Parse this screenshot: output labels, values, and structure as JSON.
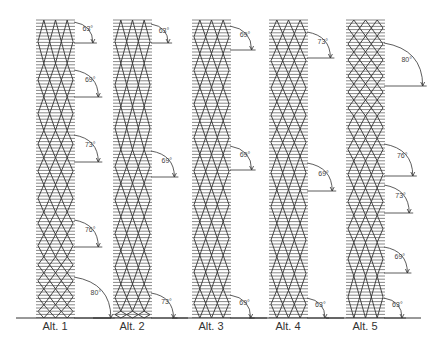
{
  "figure": {
    "baseline_y": 318,
    "top_y": 20,
    "columns": [
      {
        "label": "Alt. 1",
        "x": 38,
        "width": 35,
        "angles": [
          {
            "value": "63°",
            "y_top": 22,
            "y_bottom": 43
          },
          {
            "value": "69°",
            "y_top": 70,
            "y_bottom": 97
          },
          {
            "value": "73°",
            "y_top": 135,
            "y_bottom": 162
          },
          {
            "value": "76°",
            "y_top": 220,
            "y_bottom": 247
          },
          {
            "value": "80°",
            "y_top": 277,
            "y_bottom": 318
          }
        ]
      },
      {
        "label": "Alt. 2",
        "x": 115,
        "width": 35,
        "angles": [
          {
            "value": "63°",
            "y_top": 24,
            "y_bottom": 43
          },
          {
            "value": "69°",
            "y_top": 151,
            "y_bottom": 177
          },
          {
            "value": "73°",
            "y_top": 293,
            "y_bottom": 318
          }
        ]
      },
      {
        "label": "Alt. 3",
        "x": 194,
        "width": 35,
        "angles": [
          {
            "value": "69°",
            "y_top": 26,
            "y_bottom": 50
          },
          {
            "value": "69°",
            "y_top": 146,
            "y_bottom": 170
          },
          {
            "value": "69°",
            "y_top": 295,
            "y_bottom": 318
          }
        ]
      },
      {
        "label": "Alt. 4",
        "x": 271,
        "width": 35,
        "angles": [
          {
            "value": "73°",
            "y_top": 32,
            "y_bottom": 58
          },
          {
            "value": "69°",
            "y_top": 163,
            "y_bottom": 191
          },
          {
            "value": "63°",
            "y_top": 298,
            "y_bottom": 318
          }
        ]
      },
      {
        "label": "Alt. 5",
        "x": 348,
        "width": 35,
        "angles": [
          {
            "value": "80°",
            "y_top": 43,
            "y_bottom": 86
          },
          {
            "value": "76°",
            "y_top": 144,
            "y_bottom": 176
          },
          {
            "value": "73°",
            "y_top": 185,
            "y_bottom": 213
          },
          {
            "value": "69°",
            "y_top": 247,
            "y_bottom": 273
          },
          {
            "value": "63°",
            "y_top": 298,
            "y_bottom": 318
          }
        ]
      }
    ],
    "colors": {
      "line": "#333333",
      "hatch": "#555555",
      "background": "#ffffff"
    }
  }
}
